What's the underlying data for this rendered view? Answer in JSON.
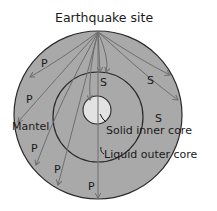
{
  "title": "Earthquake site",
  "labels": {
    "mantle": "Mantel",
    "inner_core": "Solid inner core",
    "outer_core": "Liquid outer core"
  },
  "wave_labels": {
    "p": "P",
    "s": "S"
  },
  "colors": {
    "mantle": "#a9a9a9",
    "outer_core": "#a9a9a9",
    "inner_core": "#e2e2e2",
    "outline": "#2a2a2a",
    "wave_path": "#6e6e6e",
    "text": "#1a1a1a"
  }
}
